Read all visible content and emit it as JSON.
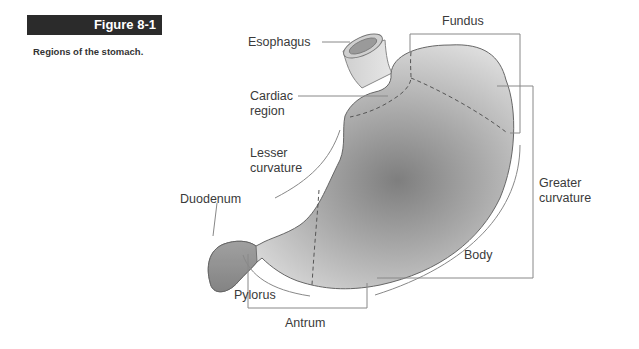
{
  "figure": {
    "number": "Figure 8-1",
    "caption": "Regions of the stomach."
  },
  "labels": {
    "esophagus": "Esophagus",
    "cardiac_1": "Cardiac",
    "cardiac_2": "region",
    "fundus": "Fundus",
    "lesser_1": "Lesser",
    "lesser_2": "curvature",
    "greater_1": "Greater",
    "greater_2": "curvature",
    "duodenum": "Duodenum",
    "body": "Body",
    "pylorus": "Pylorus",
    "antrum": "Antrum"
  },
  "colors": {
    "header_bg": "#2b2b2b",
    "stomach_light": "#dcdcdc",
    "stomach_dark": "#8a8a8a",
    "line": "#888888"
  }
}
